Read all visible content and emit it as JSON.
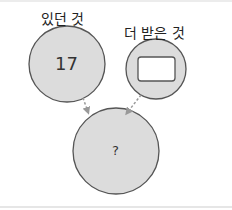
{
  "diagram": {
    "left_node": {
      "label": "있던 것",
      "value": "17"
    },
    "right_node": {
      "label": "더 받은 것",
      "value_icon": "empty-box"
    },
    "result_node": {
      "value": "?"
    },
    "colors": {
      "circle_fill": "#dcdcdc",
      "circle_stroke": "#555555",
      "arrow": "#999999",
      "box_fill": "#ffffff"
    }
  }
}
